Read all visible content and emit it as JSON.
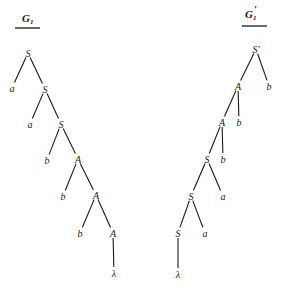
{
  "trees": [
    {
      "id": "left",
      "title": "G",
      "title_sub": "1",
      "title_prime": "",
      "title_pos": [
        22,
        22
      ],
      "underline": [
        15,
        40,
        28
      ],
      "nodes": [
        {
          "label": "S",
          "x": 28,
          "y": 53
        },
        {
          "label": "a",
          "x": 12,
          "y": 88
        },
        {
          "label": "S",
          "x": 45,
          "y": 89
        },
        {
          "label": "a",
          "x": 30,
          "y": 124
        },
        {
          "label": "S",
          "x": 61,
          "y": 124
        },
        {
          "label": "b",
          "x": 47,
          "y": 160
        },
        {
          "label": "A",
          "x": 78,
          "y": 159
        },
        {
          "label": "b",
          "x": 63,
          "y": 196
        },
        {
          "label": "A",
          "x": 96,
          "y": 195
        },
        {
          "label": "b",
          "x": 80,
          "y": 233
        },
        {
          "label": "A",
          "x": 113,
          "y": 233
        },
        {
          "label": "λ",
          "x": 114,
          "y": 273
        }
      ],
      "edges": [
        [
          0,
          1
        ],
        [
          0,
          2
        ],
        [
          2,
          3
        ],
        [
          2,
          4
        ],
        [
          4,
          5
        ],
        [
          4,
          6
        ],
        [
          6,
          7
        ],
        [
          6,
          8
        ],
        [
          8,
          9
        ],
        [
          8,
          10
        ],
        [
          10,
          11
        ]
      ]
    },
    {
      "id": "right",
      "title": "G",
      "title_sub": "1",
      "title_prime": "'",
      "title_pos": [
        245,
        18
      ],
      "underline": [
        242,
        267,
        26
      ],
      "nodes": [
        {
          "label": "S'",
          "x": 256,
          "y": 49
        },
        {
          "label": "A",
          "x": 238,
          "y": 86
        },
        {
          "label": "b",
          "x": 269,
          "y": 86
        },
        {
          "label": "A",
          "x": 222,
          "y": 122
        },
        {
          "label": "b",
          "x": 239,
          "y": 122
        },
        {
          "label": "S",
          "x": 207,
          "y": 159
        },
        {
          "label": "b",
          "x": 223,
          "y": 159
        },
        {
          "label": "S",
          "x": 191,
          "y": 196
        },
        {
          "label": "a",
          "x": 223,
          "y": 196
        },
        {
          "label": "S",
          "x": 178,
          "y": 233
        },
        {
          "label": "a",
          "x": 205,
          "y": 233
        },
        {
          "label": "λ",
          "x": 178,
          "y": 274
        }
      ],
      "edges": [
        [
          0,
          1
        ],
        [
          0,
          2
        ],
        [
          1,
          3
        ],
        [
          1,
          4
        ],
        [
          3,
          5
        ],
        [
          3,
          6
        ],
        [
          5,
          7
        ],
        [
          5,
          8
        ],
        [
          7,
          9
        ],
        [
          7,
          10
        ],
        [
          9,
          11
        ]
      ]
    }
  ]
}
